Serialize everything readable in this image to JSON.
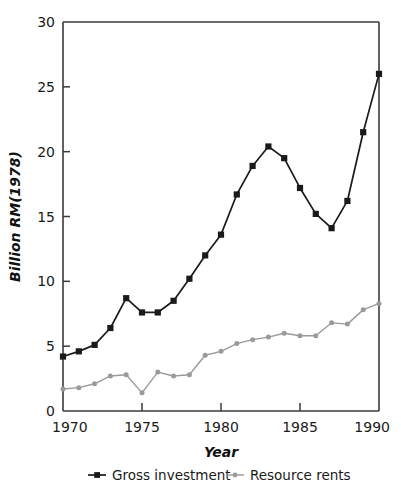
{
  "chart_data": {
    "type": "line",
    "title": "",
    "xlabel": "Year",
    "ylabel": "Billion RM(1978)",
    "xlim": [
      1970,
      1990
    ],
    "ylim": [
      0,
      30
    ],
    "grid": false,
    "legend_position": "bottom",
    "x": [
      1970,
      1971,
      1972,
      1973,
      1974,
      1975,
      1976,
      1977,
      1978,
      1979,
      1980,
      1981,
      1982,
      1983,
      1984,
      1985,
      1986,
      1987,
      1988,
      1989,
      1990
    ],
    "xticks": [
      1970,
      1975,
      1980,
      1985,
      1990
    ],
    "xtick_labels": [
      "1970",
      "1975",
      "1980",
      "1985",
      "1990"
    ],
    "yticks": [
      0,
      5,
      10,
      15,
      20,
      25,
      30
    ],
    "ytick_labels": [
      "0",
      "5",
      "10",
      "15",
      "20",
      "25",
      "30"
    ],
    "series": [
      {
        "name": "Gross investment",
        "color": "#1a1a1a",
        "marker": "square",
        "values": [
          4.2,
          4.6,
          5.1,
          6.4,
          8.7,
          7.6,
          7.6,
          8.5,
          10.2,
          12.0,
          13.6,
          16.7,
          18.9,
          20.4,
          19.5,
          17.2,
          15.2,
          14.1,
          16.2,
          21.5,
          26.0
        ]
      },
      {
        "name": "Resource rents",
        "color": "#9a9a9a",
        "marker": "circle",
        "values": [
          1.7,
          1.8,
          2.1,
          2.7,
          2.8,
          1.4,
          3.0,
          2.7,
          2.8,
          4.3,
          4.6,
          5.2,
          5.5,
          5.7,
          6.0,
          5.8,
          5.8,
          6.8,
          6.7,
          7.8,
          8.3
        ]
      }
    ]
  },
  "legend": {
    "items": [
      {
        "label": "Gross investment",
        "color": "#1a1a1a",
        "marker": "square"
      },
      {
        "label": "Resource rents",
        "color": "#9a9a9a",
        "marker": "circle"
      }
    ]
  }
}
